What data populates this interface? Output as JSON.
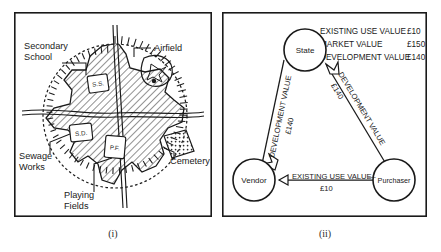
{
  "figure": {
    "caption_left": "(i)",
    "caption_right": "(ii)"
  },
  "map_panel": {
    "name": "town-map",
    "labels": {
      "secondary_school_line1": "Secondary",
      "secondary_school_line2": "School",
      "airfield": "Airfield",
      "sewage_works_line1": "Sewage",
      "sewage_works_line2": "Works",
      "playing_fields_line1": "Playing",
      "playing_fields_line2": "Fields",
      "cemetery": "Cemetery"
    },
    "site_markers": {
      "secondary_school": "S.S.",
      "sewage_disposal": "S.D.",
      "playing_field": "P.F."
    }
  },
  "diagram_panel": {
    "name": "value-transfer-diagram",
    "legend": [
      {
        "label": "EXISTING USE VALUE",
        "value": "£10"
      },
      {
        "label": "MARKET VALUE",
        "value": "£150"
      },
      {
        "label": "DEVELOPMENT VALUE",
        "value": "£140"
      }
    ],
    "nodes": [
      {
        "id": "state",
        "label": "State"
      },
      {
        "id": "vendor",
        "label": "Vendor"
      },
      {
        "id": "purchaser",
        "label": "Purchaser"
      }
    ],
    "flows": [
      {
        "id": "vendor-to-state",
        "label": "DEVELOPMENT VALUE",
        "amount": "£140",
        "from": "Vendor",
        "to": "State"
      },
      {
        "id": "purchaser-to-state",
        "label": "DEVELOPMENT VALUE",
        "amount": "£140",
        "from": "Purchaser",
        "to": "State"
      },
      {
        "id": "purchaser-to-vendor",
        "label": "EXISTING USE VALUE",
        "amount": "£10",
        "from": "Purchaser",
        "to": "Vendor"
      }
    ]
  },
  "colors": {
    "ink": "#1a1a1a",
    "paper": "#ffffff",
    "hatch": "#3a3a3a"
  }
}
